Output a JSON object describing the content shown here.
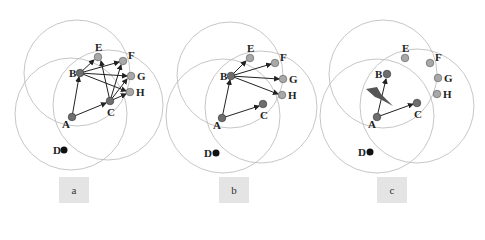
{
  "colors": {
    "range_circle": "#b8b8b8",
    "node_dark": "#6e6e6e",
    "node_light": "#a8a8a8",
    "node_black": "#111111",
    "edge": "#222222",
    "label_box": "#e4e4e4",
    "jammer": "#555555"
  },
  "panels": [
    {
      "label": "a",
      "nodes": {
        "A": "A",
        "B": "B",
        "C": "C",
        "D": "D",
        "E": "E",
        "F": "F",
        "G": "G",
        "H": "H"
      },
      "edges": [
        "A→B",
        "A→C",
        "B→E",
        "B→F",
        "B→G",
        "B→H",
        "C→E",
        "C→F",
        "C→G",
        "C→H"
      ]
    },
    {
      "label": "b",
      "nodes": {
        "A": "A",
        "B": "B",
        "C": "C",
        "D": "D",
        "E": "E",
        "F": "F",
        "G": "G",
        "H": "H"
      },
      "edges": [
        "A→B",
        "A→C",
        "B→E",
        "B→F",
        "B→G",
        "B→H"
      ]
    },
    {
      "label": "c",
      "nodes": {
        "A": "A",
        "B": "B",
        "C": "C",
        "D": "D",
        "E": "E",
        "F": "F",
        "G": "G",
        "H": "H"
      },
      "edges": [
        "A→B",
        "A→C"
      ],
      "jammer": "lightning-bolt"
    }
  ]
}
